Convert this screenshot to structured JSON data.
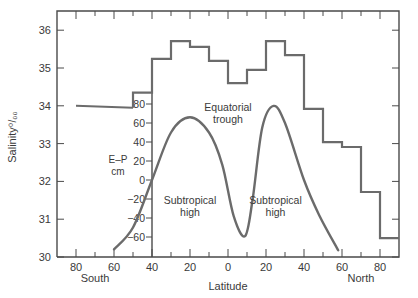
{
  "chart_data": {
    "type": "line",
    "title": "",
    "xlabel": "Latitude",
    "x_hemisphere_labels": {
      "south": "South",
      "north": "North"
    },
    "x_tick_labels": [
      "80",
      "60",
      "40",
      "20",
      "0",
      "20",
      "40",
      "60",
      "80"
    ],
    "x_tick_values": [
      -80,
      -60,
      -40,
      -20,
      0,
      20,
      40,
      60,
      80
    ],
    "xlim": [
      -90,
      90
    ],
    "grid": false,
    "legend": null,
    "axes": [
      {
        "name": "salinity",
        "ylabel": "Salinity ‰",
        "ylabel_text": "Salinity",
        "ylabel_unit": "o/oo",
        "ylim": [
          30,
          36.5
        ],
        "y_tick_labels": [
          "36",
          "35",
          "34",
          "33",
          "32",
          "31",
          "30"
        ],
        "y_tick_values": [
          36,
          35,
          34,
          33,
          32,
          31,
          30
        ]
      },
      {
        "name": "e_minus_p",
        "ylabel": "E–P cm",
        "ylabel_line1": "E–P",
        "ylabel_line2": "cm",
        "ylim": [
          -80,
          80
        ],
        "y_tick_labels": [
          "80",
          "60",
          "40",
          "20",
          "0",
          "−20",
          "−40",
          "−60"
        ],
        "y_tick_values": [
          80,
          60,
          40,
          20,
          0,
          -20,
          -40,
          -60
        ]
      }
    ],
    "series": [
      {
        "name": "Surface salinity (zonal mean)",
        "style": "step",
        "axis": "salinity",
        "continuous_segment": {
          "x": [
            -80,
            -50
          ],
          "y": [
            34.0,
            33.95
          ]
        },
        "bins": [
          {
            "from": -50,
            "to": -40,
            "value": 34.35
          },
          {
            "from": -40,
            "to": -30,
            "value": 35.24
          },
          {
            "from": -30,
            "to": -20,
            "value": 35.71
          },
          {
            "from": -20,
            "to": -10,
            "value": 35.56
          },
          {
            "from": -10,
            "to": 0,
            "value": 35.19
          },
          {
            "from": 0,
            "to": 10,
            "value": 34.6
          },
          {
            "from": 10,
            "to": 20,
            "value": 34.95
          },
          {
            "from": 20,
            "to": 30,
            "value": 35.71
          },
          {
            "from": 30,
            "to": 40,
            "value": 35.34
          },
          {
            "from": 40,
            "to": 50,
            "value": 33.92
          },
          {
            "from": 50,
            "to": 60,
            "value": 33.04
          },
          {
            "from": 60,
            "to": 70,
            "value": 32.91
          },
          {
            "from": 70,
            "to": 80,
            "value": 31.72
          },
          {
            "from": 80,
            "to": 90,
            "value": 30.5
          }
        ]
      },
      {
        "name": "Evaporation minus precipitation",
        "style": "smooth",
        "axis": "e_minus_p",
        "x": [
          -60,
          -50,
          -40,
          -30,
          -20,
          -10,
          -3,
          3,
          9,
          13,
          18,
          24,
          30,
          40,
          48,
          58
        ],
        "y": [
          -73,
          -50,
          0,
          50,
          66,
          50,
          16,
          -38,
          -59,
          -20,
          55,
          78,
          60,
          0,
          -37,
          -74
        ]
      }
    ],
    "annotations": [
      {
        "text_line1": "Equatorial",
        "text_line2": "trough",
        "x": 0,
        "y_ep": 73
      },
      {
        "text_line1": "Subtropical",
        "text_line2": "high",
        "x": -20,
        "y_ep": -25
      },
      {
        "text_line1": "Subtropical",
        "text_line2": "high",
        "x": 25,
        "y_ep": -25
      }
    ]
  }
}
